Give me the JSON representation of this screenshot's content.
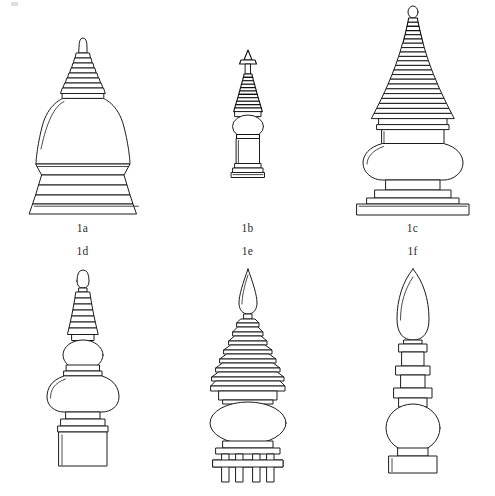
{
  "plate": {
    "id": "figure-1",
    "background_color": "#ffffff",
    "ink_color": "#1c1c1c",
    "width": 495,
    "height": 496,
    "artifact_mark": "scan-speck"
  },
  "rows": [
    {
      "name": "top-row",
      "caption_position": "below",
      "figures": [
        {
          "label": "1a",
          "name": "stupa-1a",
          "description": "bell-dome stupa with stepped square plinth and ringed conical spire",
          "elements": [
            "bud-finial",
            "ringed-spire",
            "bell-dome",
            "moulded-torus",
            "stepped-base"
          ],
          "spire_rings": 8,
          "base_tiers": 4
        },
        {
          "label": "1b",
          "name": "stupa-1b",
          "description": "slender stupa with globular dome and tall needle spire",
          "elements": [
            "pointed-finial",
            "ringed-spire",
            "globular-dome",
            "cylindrical-drum",
            "ringed-base"
          ],
          "spire_rings": 11,
          "base_tiers": 3
        },
        {
          "label": "1c",
          "name": "stupa-1c",
          "description": "tall many-ringed conical spire over vase dome on a broad stepped platform",
          "elements": [
            "bud-finial",
            "ringed-spire",
            "vase-dome",
            "harmika",
            "stepped-platform"
          ],
          "spire_rings": 22,
          "base_tiers": 3
        }
      ]
    },
    {
      "name": "bottom-row",
      "caption_position": "above",
      "figures": [
        {
          "label": "1d",
          "name": "stupa-1d",
          "description": "finial of stacked spheres with ringed tapering spire on a block base",
          "elements": [
            "bud-finial",
            "ringed-spire",
            "upper-sphere",
            "lower-bulb",
            "block-base"
          ],
          "spire_rings": 7,
          "base_tiers": 2
        },
        {
          "label": "1e",
          "name": "stupa-1e",
          "description": "pagoda-type finial with flame tip, disc tiers, ovoid dome and four legs",
          "elements": [
            "flame-finial",
            "disc-tiers",
            "ovoid-dome",
            "platform",
            "legs"
          ],
          "disc_tiers": 8,
          "legs": 4
        },
        {
          "label": "1f",
          "name": "stupa-1f",
          "description": "leaf-shaped finial above collar rings, sphere and rectangular base",
          "elements": [
            "leaf-finial",
            "collar-rings",
            "sphere",
            "rectangular-base"
          ],
          "collar_rings": 3,
          "base_tiers": 2
        }
      ]
    }
  ]
}
